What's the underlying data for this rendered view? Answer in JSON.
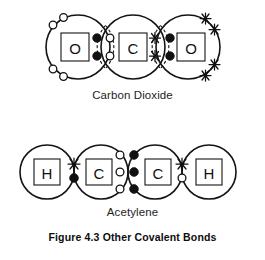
{
  "figure": {
    "caption": "Figure 4.3 Other Covalent Bonds",
    "background_color": "#ffffff",
    "ink_color": "#141414"
  },
  "molecules": [
    {
      "id": "carbon-dioxide",
      "label": "Carbon Dioxide",
      "formula": "CO2",
      "atoms": [
        {
          "symbol": "O",
          "name": "oxygen-left",
          "cx": 78,
          "cy": 47,
          "r": 32,
          "electron_glyph": "open-circle"
        },
        {
          "symbol": "C",
          "name": "carbon-center",
          "cx": 133,
          "cy": 47,
          "r": 32,
          "electron_glyph": "star"
        },
        {
          "symbol": "O",
          "name": "oxygen-right",
          "cx": 188,
          "cy": 47,
          "r": 32,
          "electron_glyph": "filled-dot"
        }
      ],
      "bonds": [
        {
          "name": "bond-o-left-c",
          "type": "double",
          "pairs": 2,
          "left_glyph": "filled-dot",
          "right_glyph": "open-circle"
        },
        {
          "name": "bond-c-o-right",
          "type": "double",
          "pairs": 2,
          "left_glyph": "star",
          "right_glyph": "filled-dot"
        }
      ],
      "lone_pairs": {
        "oxygen_left": {
          "glyph": "open-circle",
          "count": 4
        },
        "oxygen_right": {
          "glyph": "star",
          "count": 4
        }
      }
    },
    {
      "id": "acetylene",
      "label": "Acetylene",
      "formula": "C2H2",
      "atoms": [
        {
          "symbol": "H",
          "name": "hydrogen-left",
          "cx": 47,
          "cy": 172,
          "r": 27,
          "electron_glyph": "star"
        },
        {
          "symbol": "C",
          "name": "carbon-left",
          "cx": 101,
          "cy": 172,
          "r": 27,
          "electron_glyph": "open-circle"
        },
        {
          "symbol": "C",
          "name": "carbon-right",
          "cx": 155,
          "cy": 172,
          "r": 27,
          "electron_glyph": "filled-dot"
        },
        {
          "symbol": "H",
          "name": "hydrogen-right",
          "cx": 209,
          "cy": 172,
          "r": 27,
          "electron_glyph": "open-circle"
        }
      ],
      "bonds": [
        {
          "name": "bond-h-left-c",
          "type": "single",
          "pairs": 1,
          "left_glyph": "star",
          "right_glyph": "filled-dot"
        },
        {
          "name": "bond-c-c",
          "type": "triple",
          "pairs": 3,
          "left_glyph": "open-circle",
          "right_glyph": "filled-dot"
        },
        {
          "name": "bond-c-h-right",
          "type": "single",
          "pairs": 1,
          "left_glyph": "star",
          "right_glyph": "open-circle"
        }
      ],
      "lone_pairs": {}
    }
  ],
  "symbols": {
    "oxygen": "O",
    "carbon": "C",
    "hydrogen": "H"
  }
}
